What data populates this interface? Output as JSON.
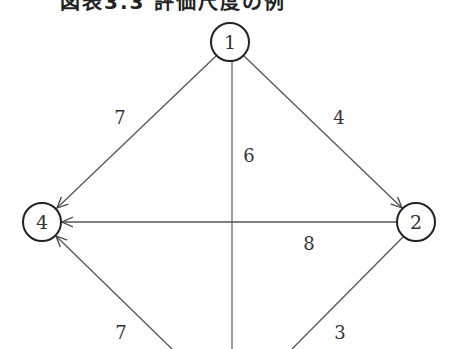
{
  "title": "図表3.3 評価尺度の例",
  "diagram": {
    "type": "directed-weighted-graph",
    "nodes": [
      {
        "id": "1",
        "label": "1",
        "x": 230,
        "y": 42
      },
      {
        "id": "2",
        "label": "2",
        "x": 416,
        "y": 222
      },
      {
        "id": "3",
        "label": "3",
        "x": 232,
        "y": 400
      },
      {
        "id": "4",
        "label": "4",
        "x": 42,
        "y": 222
      }
    ],
    "edges": [
      {
        "from": "1",
        "to": "4",
        "weight": "7"
      },
      {
        "from": "1",
        "to": "2",
        "weight": "4"
      },
      {
        "from": "1",
        "to": "3",
        "weight": "6"
      },
      {
        "from": "2",
        "to": "4",
        "weight": "8"
      },
      {
        "from": "3",
        "to": "4",
        "weight": "7"
      },
      {
        "from": "2",
        "to": "3",
        "weight": "3"
      }
    ]
  },
  "labels": {
    "node1": "1",
    "node2": "2",
    "node4": "4",
    "edge_1_4": "7",
    "edge_1_2": "4",
    "edge_1_3": "6",
    "edge_2_4": "8",
    "edge_3_4": "7",
    "edge_2_3": "3"
  },
  "colors": {
    "line": "#555555",
    "node_stroke": "#222222",
    "text": "#333333",
    "background": "#ffffff"
  }
}
